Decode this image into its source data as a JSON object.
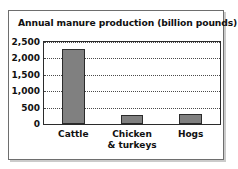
{
  "chart_data": {
    "type": "bar",
    "title": "Annual manure production (billion pounds)",
    "xlabel": "",
    "ylabel": "",
    "categories": [
      "Cattle",
      "Chicken & turkeys",
      "Hogs"
    ],
    "category_lines": [
      [
        "Cattle"
      ],
      [
        "Chicken",
        "& turkeys"
      ],
      [
        "Hogs"
      ]
    ],
    "values": [
      2300,
      280,
      300
    ],
    "ylim": [
      0,
      2500
    ],
    "yticks": [
      0,
      500,
      1000,
      1500,
      2000,
      2500
    ],
    "ytick_labels": [
      "0",
      "500",
      "1,000",
      "1,500",
      "2,000",
      "2,500"
    ],
    "grid": true,
    "grid_style": "dotted",
    "legend": false,
    "bar_color": "#808080",
    "bar_edge_color": "#2b2b2b",
    "axis_color": "#2b2b2b",
    "frame_color": "#6e6e6e",
    "background": "#ffffff"
  }
}
